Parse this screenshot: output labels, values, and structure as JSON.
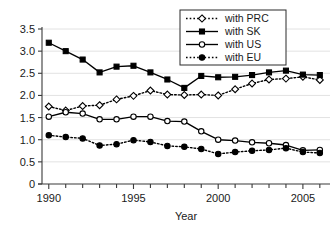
{
  "caption": {
    "partial_text": "partially cropped caption line"
  },
  "chart_data": {
    "type": "line",
    "title": "",
    "xlabel": "Year",
    "ylabel": "",
    "x": [
      1990,
      1991,
      1992,
      1993,
      1994,
      1995,
      1996,
      1997,
      1998,
      1999,
      2000,
      2001,
      2002,
      2003,
      2004,
      2005,
      2006
    ],
    "xticks": [
      1990,
      1995,
      2000,
      2005
    ],
    "xtick_labels": [
      "1990",
      "1995",
      "2000",
      "2005"
    ],
    "xminor_ticks": [
      1990,
      1991,
      1992,
      1993,
      1994,
      1995,
      1996,
      1997,
      1998,
      1999,
      2000,
      2001,
      2002,
      2003,
      2004,
      2005,
      2006
    ],
    "xlim": [
      1989.6,
      2006.6
    ],
    "yticks": [
      0,
      0.5,
      1.0,
      1.5,
      2.0,
      2.5,
      3.0,
      3.5
    ],
    "ytick_labels": [
      "0",
      "0.5",
      "1.0",
      "1.5",
      "2.0",
      "2.5",
      "3.0",
      "3.5"
    ],
    "ylim": [
      0,
      3.5
    ],
    "grid": true,
    "legend_position": "top-right",
    "series": [
      {
        "name": "with PRC",
        "linestyle": "dotted",
        "marker": "open-diamond",
        "color": "#000000",
        "values": [
          1.75,
          1.66,
          1.76,
          1.78,
          1.91,
          1.99,
          2.11,
          2.02,
          2.01,
          2.02,
          2.0,
          2.14,
          2.27,
          2.36,
          2.38,
          2.42,
          2.35
        ]
      },
      {
        "name": "with SK",
        "linestyle": "solid",
        "marker": "filled-square",
        "color": "#000000",
        "values": [
          3.19,
          3.0,
          2.81,
          2.52,
          2.65,
          2.67,
          2.52,
          2.36,
          2.17,
          2.44,
          2.41,
          2.42,
          2.46,
          2.52,
          2.56,
          2.47,
          2.46
        ]
      },
      {
        "name": "with US",
        "linestyle": "solid",
        "marker": "open-circle",
        "color": "#000000",
        "values": [
          1.52,
          1.62,
          1.59,
          1.46,
          1.46,
          1.52,
          1.52,
          1.42,
          1.41,
          1.19,
          1.0,
          0.98,
          0.94,
          0.92,
          0.88,
          0.76,
          0.77
        ]
      },
      {
        "name": "with EU",
        "linestyle": "dotted",
        "marker": "filled-circle",
        "color": "#000000",
        "values": [
          1.1,
          1.06,
          1.03,
          0.87,
          0.9,
          0.99,
          0.95,
          0.86,
          0.84,
          0.79,
          0.68,
          0.72,
          0.75,
          0.77,
          0.81,
          0.72,
          0.7
        ]
      }
    ]
  },
  "legend": {
    "items": [
      {
        "label": "with PRC"
      },
      {
        "label": "with SK"
      },
      {
        "label": "with US"
      },
      {
        "label": "with EU"
      }
    ]
  },
  "axes": {
    "x_title": "Year"
  }
}
